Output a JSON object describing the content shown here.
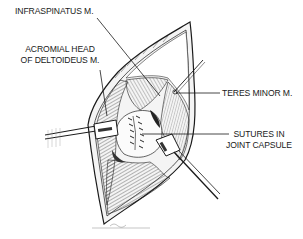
{
  "figure": {
    "colors": {
      "ink": "#1a1a1a",
      "background": "#ffffff",
      "tissue_shade": "#6a6a6a"
    },
    "labels": [
      {
        "id": "infraspinatus",
        "lines": [
          "INFRASPINATUS M."
        ]
      },
      {
        "id": "acromial-head",
        "lines": [
          "ACROMIAL HEAD",
          "OF DELTOIDEUS M."
        ]
      },
      {
        "id": "teres-minor",
        "lines": [
          "TERES MINOR M."
        ]
      },
      {
        "id": "sutures",
        "lines": [
          "SUTURES IN",
          "JOINT CAPSULE"
        ]
      }
    ]
  }
}
